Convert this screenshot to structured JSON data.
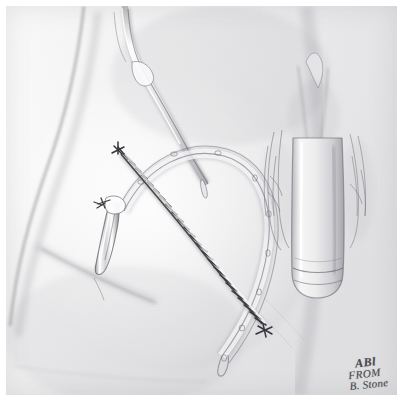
{
  "artwork": {
    "medium": "graphite pencil drawing",
    "subject": "surgical illustration of lower abdomen and groin with sutured oblique incision and subcutaneous drain",
    "palette": {
      "paper": "#ececed",
      "paper_light": "#f4f4f5",
      "paper_shadow": "#d7d7da",
      "graphite_dark": "#3c3c3e",
      "graphite_mid": "#767679",
      "graphite_light": "#a9a9ad",
      "margin": "#ffffff"
    }
  },
  "signature": {
    "line1": "ABl",
    "line2": "FROM",
    "line3": "B. Stone"
  },
  "elements": {
    "catheter_label": "catheter-tube-upper",
    "incision_label": "sutured-oblique-incision",
    "drain_label": "fenestrated-drain-tube",
    "drain_exit_label": "drain-exit-site-tube",
    "anatomy_label": "genital-anatomy",
    "torso_label": "torso-contour",
    "stitch_count": 26
  }
}
